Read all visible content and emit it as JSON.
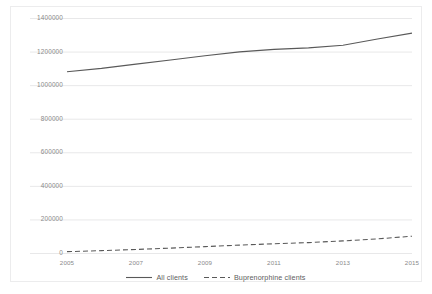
{
  "chart_data": {
    "type": "line",
    "title": "",
    "subtitle": "",
    "xlabel": "",
    "ylabel": "",
    "x": [
      2005,
      2006,
      2007,
      2008,
      2009,
      2010,
      2011,
      2012,
      2013,
      2014,
      2015
    ],
    "xlim": [
      2005,
      2015
    ],
    "ylim": [
      0,
      1400000
    ],
    "grid": true,
    "grid_axis": "y",
    "legend_position": "bottom-center",
    "y_ticks": [
      0,
      200000,
      400000,
      600000,
      800000,
      1000000,
      1200000,
      1400000
    ],
    "y_tick_labels": [
      "0",
      "200000",
      "400000",
      "600000",
      "800000",
      "1000000",
      "1200000",
      "1400000"
    ],
    "x_ticks": [
      2005,
      2007,
      2009,
      2011,
      2013,
      2015
    ],
    "x_tick_labels": [
      "2005",
      "2007",
      "2009",
      "2011",
      "2013",
      "2015"
    ],
    "series": [
      {
        "name": "All clients",
        "style": "solid",
        "color": "#595959",
        "values": [
          1080000,
          1100000,
          1125000,
          1150000,
          1175000,
          1198000,
          1213000,
          1222000,
          1238000,
          1275000,
          1310000
        ]
      },
      {
        "name": "Buprenorphine clients",
        "style": "dashed",
        "color": "#595959",
        "values": [
          8000,
          14000,
          21000,
          29000,
          38000,
          47000,
          55000,
          62000,
          72000,
          84000,
          100000
        ]
      }
    ]
  },
  "legend": {
    "items": [
      {
        "label": "All clients",
        "style": "solid"
      },
      {
        "label": "Buprenorphine clients",
        "style": "dashed"
      }
    ]
  },
  "colors": {
    "series_line": "#595959",
    "gridline": "#e8e8e9",
    "tick_text": "#8a8a8a",
    "legend_text": "#5d5d5d",
    "frame_border": "#ececed",
    "background": "#ffffff"
  }
}
